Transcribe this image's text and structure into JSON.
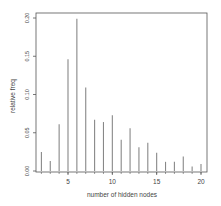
{
  "chart_data": {
    "type": "bar",
    "subtype": "histogram-spikes",
    "title": "",
    "xlabel": "number of hidden nodes",
    "ylabel": "relative freq",
    "x": [
      2,
      3,
      4,
      5,
      6,
      7,
      8,
      9,
      10,
      11,
      12,
      13,
      14,
      15,
      16,
      17,
      18,
      19,
      20
    ],
    "values": [
      0.025,
      0.013,
      0.061,
      0.146,
      0.199,
      0.109,
      0.067,
      0.064,
      0.073,
      0.041,
      0.056,
      0.031,
      0.037,
      0.024,
      0.012,
      0.012,
      0.019,
      0.006,
      0.009
    ],
    "xlim": [
      1.5,
      20.7
    ],
    "ylim": [
      0.0,
      0.207
    ],
    "xticks": [
      5,
      10,
      15,
      20
    ],
    "xtick_labels": [
      "5",
      "10",
      "15",
      "20"
    ],
    "yticks": [
      0.0,
      0.05,
      0.1,
      0.15,
      0.2
    ],
    "ytick_labels": [
      "0.00",
      "0.05",
      "0.10",
      "0.15",
      "0.20"
    ],
    "grid": false,
    "legend": null,
    "colors": {
      "bars": "#888888",
      "axis": "#555555",
      "text": "#444444"
    }
  }
}
